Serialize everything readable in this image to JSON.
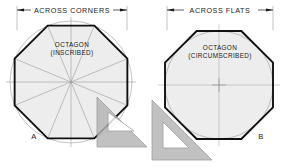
{
  "figure": {
    "title_present": false,
    "background": "#ffffff",
    "ink_color": "#1a1a1a",
    "construction_line_color": "#9a9a9a",
    "circle_color": "#a8a8a8",
    "shade_fill": "#ededed",
    "tool_fill": "#b4b4b4",
    "tool_edge": "#8c8c8c"
  },
  "panels": [
    {
      "id": "panel-a",
      "key": "A",
      "dimension_label": "ACROSS CORNERS",
      "shape_label_line1": "OCTAGON",
      "shape_label_line2": "(INSCRIBED)",
      "center": {
        "x": 71,
        "y": 82
      },
      "circle_radius": 61,
      "octagon_type": "inscribed",
      "octagon_vertex_radius": 61,
      "octagon_rotation_deg": 22.5,
      "spokes": 8,
      "dimension": {
        "y": 10,
        "x_start": 17,
        "x_end": 127,
        "text_x": 72,
        "text_y": 12.4,
        "extension_left_x": 17,
        "extension_right_x": 127,
        "extension_top_y": 6,
        "extension_bottom_y": 30
      },
      "key_pos": {
        "x": 34,
        "y": 139
      },
      "triangle": {
        "name": "45-degree-set-square",
        "points": "97,97 147,147 97,147",
        "cutout": "108,131 134,131 108,112"
      }
    },
    {
      "id": "panel-b",
      "key": "B",
      "dimension_label": "ACROSS FLATS",
      "shape_label_line1": "OCTAGON",
      "shape_label_line2": "(CIRCUMSCRIBED)",
      "center": {
        "x": 219,
        "y": 85
      },
      "circle_radius": 54,
      "octagon_type": "circumscribed",
      "octagon_apothem": 54,
      "octagon_rotation_deg": 0,
      "crosshair": true,
      "dimension": {
        "y": 10,
        "x_start": 167,
        "x_end": 273,
        "text_x": 220,
        "text_y": 12.4,
        "extension_left_x": 167,
        "extension_right_x": 273,
        "extension_top_y": 6,
        "extension_bottom_y": 30
      },
      "key_pos": {
        "x": 261,
        "y": 139
      },
      "triangle": {
        "name": "45-degree-set-square",
        "points": "152,100 152,160 212,160",
        "cutout": "163,148 163,122 189,148"
      }
    }
  ]
}
